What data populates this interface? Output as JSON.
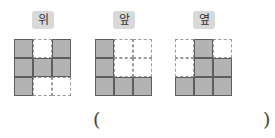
{
  "views": [
    {
      "label": "위",
      "name": "top",
      "grid": [
        [
          1,
          0,
          1
        ],
        [
          1,
          1,
          1
        ],
        [
          1,
          0,
          0
        ]
      ]
    },
    {
      "label": "앞",
      "name": "front",
      "grid": [
        [
          1,
          0,
          0
        ],
        [
          1,
          0,
          0
        ],
        [
          1,
          1,
          1
        ]
      ]
    },
    {
      "label": "옆",
      "name": "side",
      "grid": [
        [
          0,
          1,
          0
        ],
        [
          0,
          1,
          1
        ],
        [
          1,
          1,
          1
        ]
      ]
    }
  ],
  "answer": {
    "open_paren": "(",
    "close_paren": ")",
    "value": ""
  },
  "colors": {
    "filled": "#b3b3b3",
    "filled_border": "#5e5e5e",
    "empty_border": "#9a9a9a",
    "label_bg": "#d9d9d9"
  }
}
